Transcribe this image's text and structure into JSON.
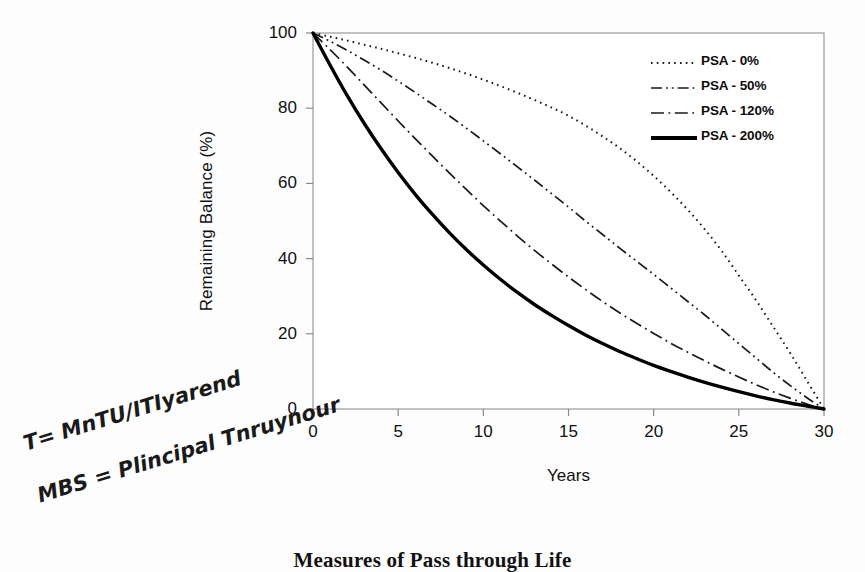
{
  "chart_data": {
    "type": "line",
    "title": "",
    "xlabel": "Years",
    "ylabel": "Remaining Balance (%)",
    "xlim": [
      0,
      30
    ],
    "ylim": [
      0,
      100
    ],
    "xticks": [
      "0",
      "5",
      "10",
      "15",
      "20",
      "25",
      "30"
    ],
    "yticks": [
      "0",
      "20",
      "40",
      "60",
      "80",
      "100"
    ],
    "grid": false,
    "legend_position": "top-right",
    "x": [
      0,
      1,
      2,
      3,
      4,
      5,
      6,
      7,
      8,
      9,
      10,
      11,
      12,
      13,
      14,
      15,
      16,
      17,
      18,
      19,
      20,
      21,
      22,
      23,
      24,
      25,
      26,
      27,
      28,
      29,
      30
    ],
    "series": [
      {
        "name": "PSA - 0%",
        "style": "dotted",
        "color": "#1a1a1a",
        "values": [
          100,
          99.0,
          98.0,
          96.9,
          95.8,
          94.6,
          93.4,
          92.1,
          90.7,
          89.2,
          87.6,
          85.9,
          84.1,
          82.2,
          80.2,
          78.0,
          75.4,
          72.5,
          69.4,
          65.9,
          62.0,
          57.7,
          53.0,
          47.8,
          42.0,
          35.5,
          29.0,
          22.0,
          15.0,
          7.5,
          0
        ]
      },
      {
        "name": "PSA - 50%",
        "style": "dash-dot-dot",
        "color": "#1a1a1a",
        "values": [
          100,
          97.8,
          95.4,
          92.8,
          90.1,
          87.2,
          84.2,
          81.1,
          78.0,
          74.7,
          71.3,
          67.9,
          64.4,
          60.9,
          57.3,
          53.7,
          50.0,
          46.4,
          42.8,
          39.3,
          35.8,
          32.2,
          28.6,
          25.0,
          21.2,
          17.4,
          13.6,
          9.8,
          6.3,
          3.0,
          0
        ]
      },
      {
        "name": "PSA - 120%",
        "style": "dash-dot",
        "color": "#1a1a1a",
        "values": [
          100,
          95.6,
          91.0,
          86.2,
          81.4,
          76.6,
          71.9,
          67.3,
          62.8,
          58.4,
          54.1,
          50.0,
          46.0,
          42.2,
          38.6,
          35.1,
          31.8,
          28.6,
          25.6,
          22.8,
          20.1,
          17.5,
          15.1,
          12.8,
          10.6,
          8.5,
          6.5,
          4.6,
          2.9,
          1.3,
          0
        ]
      },
      {
        "name": "PSA - 200%",
        "style": "solid",
        "color": "#000000",
        "values": [
          100,
          91.5,
          83.4,
          76.0,
          69.2,
          62.9,
          57.1,
          51.8,
          46.9,
          42.4,
          38.3,
          34.5,
          31.0,
          27.8,
          24.9,
          22.2,
          19.7,
          17.4,
          15.3,
          13.4,
          11.6,
          10.0,
          8.5,
          7.1,
          5.8,
          4.6,
          3.5,
          2.5,
          1.6,
          0.8,
          0
        ]
      }
    ]
  },
  "legend": {
    "items": [
      {
        "label": "PSA - 0%"
      },
      {
        "label": "PSA - 50%"
      },
      {
        "label": "PSA - 120%"
      },
      {
        "label": "PSA - 200%"
      }
    ]
  },
  "annotations": {
    "handwritten": [
      "T= MnTU/ITIyarend",
      "MBS = Plincipal Tnruynour"
    ]
  },
  "caption": {
    "text": "Measures of Pass through Life"
  },
  "colors": {
    "background": "#fdfdfd",
    "axis": "#8a8a8a",
    "ink": "#1a1a1a"
  }
}
